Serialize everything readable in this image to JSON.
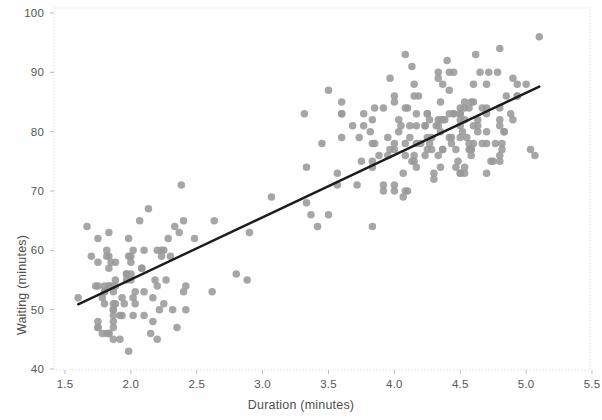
{
  "chart_data": {
    "type": "scatter",
    "title": "",
    "subtitle": "",
    "xlabel": "Duration (minutes)",
    "ylabel": "Waiting (minutes)",
    "xlim": [
      1.5,
      5.5
    ],
    "ylim": [
      40,
      100
    ],
    "xticks": [
      1.5,
      2.0,
      2.5,
      3.0,
      3.5,
      4.0,
      4.5,
      5.0,
      5.5
    ],
    "xtick_labels": [
      "1.5",
      "2.0",
      "2.5",
      "3.0",
      "3.5",
      "4.0",
      "4.5",
      "5.0",
      "5.5"
    ],
    "yticks": [
      40,
      50,
      60,
      70,
      80,
      90,
      100
    ],
    "ytick_labels": [
      "40",
      "50",
      "60",
      "70",
      "80",
      "90",
      "100"
    ],
    "grid": false,
    "legend": null,
    "marker_color": "#9a9a9a",
    "marker_size": 7.5,
    "frame_color": "#e3e3e3",
    "background_color": "#fefefe",
    "trendline": {
      "type": "linear-regression",
      "color": "#1c1c1c",
      "width": 2.4,
      "x_start": 1.6,
      "y_start": 50.9,
      "x_end": 5.1,
      "y_end": 87.6
    },
    "series": [
      {
        "name": "Old Faithful eruptions",
        "points": [
          [
            3.6,
            79
          ],
          [
            1.8,
            54
          ],
          [
            3.333,
            74
          ],
          [
            2.283,
            62
          ],
          [
            4.533,
            85
          ],
          [
            2.883,
            55
          ],
          [
            4.7,
            88
          ],
          [
            3.6,
            85
          ],
          [
            1.95,
            51
          ],
          [
            4.35,
            85
          ],
          [
            1.833,
            54
          ],
          [
            3.917,
            84
          ],
          [
            4.2,
            78
          ],
          [
            1.75,
            47
          ],
          [
            4.7,
            83
          ],
          [
            2.167,
            52
          ],
          [
            1.75,
            62
          ],
          [
            4.8,
            84
          ],
          [
            1.6,
            52
          ],
          [
            4.25,
            79
          ],
          [
            1.8,
            51
          ],
          [
            1.75,
            47
          ],
          [
            3.45,
            78
          ],
          [
            3.067,
            69
          ],
          [
            4.533,
            74
          ],
          [
            3.6,
            83
          ],
          [
            1.967,
            55
          ],
          [
            4.083,
            76
          ],
          [
            3.85,
            78
          ],
          [
            4.433,
            79
          ],
          [
            4.3,
            73
          ],
          [
            4.467,
            77
          ],
          [
            3.367,
            66
          ],
          [
            4.033,
            80
          ],
          [
            3.833,
            74
          ],
          [
            2.017,
            52
          ],
          [
            1.867,
            48
          ],
          [
            4.833,
            80
          ],
          [
            1.833,
            59
          ],
          [
            4.783,
            90
          ],
          [
            4.35,
            80
          ],
          [
            1.883,
            58
          ],
          [
            4.567,
            84
          ],
          [
            1.75,
            58
          ],
          [
            4.533,
            73
          ],
          [
            3.317,
            83
          ],
          [
            3.833,
            64
          ],
          [
            2.1,
            53
          ],
          [
            4.633,
            82
          ],
          [
            2.0,
            59
          ],
          [
            4.8,
            75
          ],
          [
            4.716,
            90
          ],
          [
            1.833,
            54
          ],
          [
            4.833,
            80
          ],
          [
            1.733,
            54
          ],
          [
            4.883,
            83
          ],
          [
            3.717,
            71
          ],
          [
            1.667,
            64
          ],
          [
            4.567,
            77
          ],
          [
            4.317,
            81
          ],
          [
            2.233,
            59
          ],
          [
            4.5,
            84
          ],
          [
            1.75,
            48
          ],
          [
            4.8,
            82
          ],
          [
            1.817,
            60
          ],
          [
            4.4,
            92
          ],
          [
            4.167,
            78
          ],
          [
            4.7,
            78
          ],
          [
            2.067,
            65
          ],
          [
            4.7,
            73
          ],
          [
            4.033,
            82
          ],
          [
            1.967,
            56
          ],
          [
            4.5,
            79
          ],
          [
            4.0,
            71
          ],
          [
            1.983,
            62
          ],
          [
            5.067,
            76
          ],
          [
            2.017,
            60
          ],
          [
            4.567,
            78
          ],
          [
            3.883,
            76
          ],
          [
            3.6,
            83
          ],
          [
            4.133,
            75
          ],
          [
            4.333,
            82
          ],
          [
            4.1,
            70
          ],
          [
            2.633,
            65
          ],
          [
            4.067,
            73
          ],
          [
            4.933,
            88
          ],
          [
            3.95,
            76
          ],
          [
            4.517,
            80
          ],
          [
            2.167,
            48
          ],
          [
            4.0,
            86
          ],
          [
            2.2,
            60
          ],
          [
            4.333,
            90
          ],
          [
            1.867,
            50
          ],
          [
            4.817,
            78
          ],
          [
            1.833,
            63
          ],
          [
            4.3,
            72
          ],
          [
            4.667,
            84
          ],
          [
            3.75,
            75
          ],
          [
            1.867,
            51
          ],
          [
            4.9,
            82
          ],
          [
            2.483,
            62
          ],
          [
            4.367,
            88
          ],
          [
            2.1,
            49
          ],
          [
            4.5,
            83
          ],
          [
            4.05,
            81
          ],
          [
            1.867,
            47
          ],
          [
            4.7,
            84
          ],
          [
            1.783,
            52
          ],
          [
            4.85,
            86
          ],
          [
            3.683,
            81
          ],
          [
            4.733,
            75
          ],
          [
            2.3,
            59
          ],
          [
            4.9,
            89
          ],
          [
            4.417,
            79
          ],
          [
            1.7,
            59
          ],
          [
            4.633,
            81
          ],
          [
            2.317,
            50
          ],
          [
            4.6,
            85
          ],
          [
            1.817,
            59
          ],
          [
            4.417,
            87
          ],
          [
            2.617,
            53
          ],
          [
            4.067,
            69
          ],
          [
            4.25,
            77
          ],
          [
            1.967,
            56
          ],
          [
            4.6,
            88
          ],
          [
            3.767,
            81
          ],
          [
            1.917,
            45
          ],
          [
            4.5,
            82
          ],
          [
            2.267,
            55
          ],
          [
            4.65,
            90
          ],
          [
            1.867,
            45
          ],
          [
            4.167,
            83
          ],
          [
            2.8,
            56
          ],
          [
            4.333,
            89
          ],
          [
            1.833,
            46
          ],
          [
            4.383,
            82
          ],
          [
            1.883,
            51
          ],
          [
            4.933,
            86
          ],
          [
            2.033,
            53
          ],
          [
            3.733,
            79
          ],
          [
            4.233,
            81
          ],
          [
            2.233,
            60
          ],
          [
            4.533,
            82
          ],
          [
            4.817,
            77
          ],
          [
            4.333,
            76
          ],
          [
            1.983,
            59
          ],
          [
            4.633,
            80
          ],
          [
            2.017,
            49
          ],
          [
            5.1,
            96
          ],
          [
            1.8,
            53
          ],
          [
            5.033,
            77
          ],
          [
            4.0,
            77
          ],
          [
            2.4,
            65
          ],
          [
            4.6,
            81
          ],
          [
            3.567,
            71
          ],
          [
            4.0,
            70
          ],
          [
            4.5,
            81
          ],
          [
            4.083,
            93
          ],
          [
            1.8,
            53
          ],
          [
            3.967,
            89
          ],
          [
            2.2,
            45
          ],
          [
            4.15,
            86
          ],
          [
            2.0,
            58
          ],
          [
            3.833,
            78
          ],
          [
            3.5,
            66
          ],
          [
            4.583,
            76
          ],
          [
            2.367,
            63
          ],
          [
            5.0,
            88
          ],
          [
            1.933,
            52
          ],
          [
            4.617,
            93
          ],
          [
            1.917,
            49
          ],
          [
            2.083,
            57
          ],
          [
            4.583,
            77
          ],
          [
            3.333,
            68
          ],
          [
            4.167,
            81
          ],
          [
            4.333,
            81
          ],
          [
            4.5,
            73
          ],
          [
            2.417,
            50
          ],
          [
            4.0,
            85
          ],
          [
            4.167,
            74
          ],
          [
            1.883,
            55
          ],
          [
            4.583,
            77
          ],
          [
            4.25,
            83
          ],
          [
            3.767,
            83
          ],
          [
            2.033,
            51
          ],
          [
            4.433,
            78
          ],
          [
            4.083,
            84
          ],
          [
            1.833,
            46
          ],
          [
            4.417,
            83
          ],
          [
            2.183,
            55
          ],
          [
            4.8,
            81
          ],
          [
            1.833,
            57
          ],
          [
            4.8,
            76
          ],
          [
            4.1,
            84
          ],
          [
            3.966,
            77
          ],
          [
            4.233,
            81
          ],
          [
            3.5,
            87
          ],
          [
            4.366,
            77
          ],
          [
            2.25,
            51
          ],
          [
            4.667,
            78
          ],
          [
            2.1,
            60
          ],
          [
            4.35,
            82
          ],
          [
            4.133,
            91
          ],
          [
            1.867,
            53
          ],
          [
            4.6,
            78
          ],
          [
            1.783,
            46
          ],
          [
            4.367,
            77
          ],
          [
            3.85,
            84
          ],
          [
            1.933,
            49
          ],
          [
            4.5,
            83
          ],
          [
            2.383,
            71
          ],
          [
            4.7,
            80
          ],
          [
            1.867,
            49
          ],
          [
            3.833,
            75
          ],
          [
            3.417,
            64
          ],
          [
            4.233,
            76
          ],
          [
            2.4,
            53
          ],
          [
            4.8,
            94
          ],
          [
            2.0,
            55
          ],
          [
            4.15,
            76
          ],
          [
            1.867,
            50
          ],
          [
            4.267,
            82
          ],
          [
            1.75,
            54
          ],
          [
            4.483,
            75
          ],
          [
            4.0,
            78
          ],
          [
            4.117,
            79
          ],
          [
            4.083,
            78
          ],
          [
            4.267,
            78
          ],
          [
            3.917,
            70
          ],
          [
            4.55,
            79
          ],
          [
            4.083,
            70
          ],
          [
            2.417,
            54
          ],
          [
            4.183,
            86
          ],
          [
            2.217,
            50
          ],
          [
            4.45,
            90
          ],
          [
            1.883,
            54
          ],
          [
            1.85,
            54
          ],
          [
            4.283,
            77
          ],
          [
            3.95,
            79
          ],
          [
            2.333,
            64
          ],
          [
            4.15,
            75
          ],
          [
            2.35,
            47
          ],
          [
            4.933,
            86
          ],
          [
            2.9,
            63
          ],
          [
            4.583,
            85
          ],
          [
            3.833,
            82
          ],
          [
            2.083,
            57
          ],
          [
            4.367,
            82
          ],
          [
            2.133,
            67
          ],
          [
            4.35,
            74
          ],
          [
            2.2,
            54
          ],
          [
            4.45,
            83
          ],
          [
            3.567,
            73
          ],
          [
            4.5,
            73
          ],
          [
            4.15,
            88
          ],
          [
            3.817,
            80
          ],
          [
            3.917,
            71
          ],
          [
            4.45,
            83
          ],
          [
            2.0,
            56
          ],
          [
            4.283,
            79
          ],
          [
            4.767,
            78
          ],
          [
            4.533,
            84
          ],
          [
            1.85,
            58
          ],
          [
            4.25,
            83
          ],
          [
            1.983,
            43
          ],
          [
            2.25,
            60
          ],
          [
            4.75,
            75
          ],
          [
            4.117,
            81
          ],
          [
            2.15,
            46
          ],
          [
            4.417,
            90
          ],
          [
            1.817,
            46
          ],
          [
            4.467,
            74
          ]
        ]
      }
    ]
  },
  "axes": {
    "x_title": "Duration (minutes)",
    "y_title": "Waiting (minutes)"
  }
}
